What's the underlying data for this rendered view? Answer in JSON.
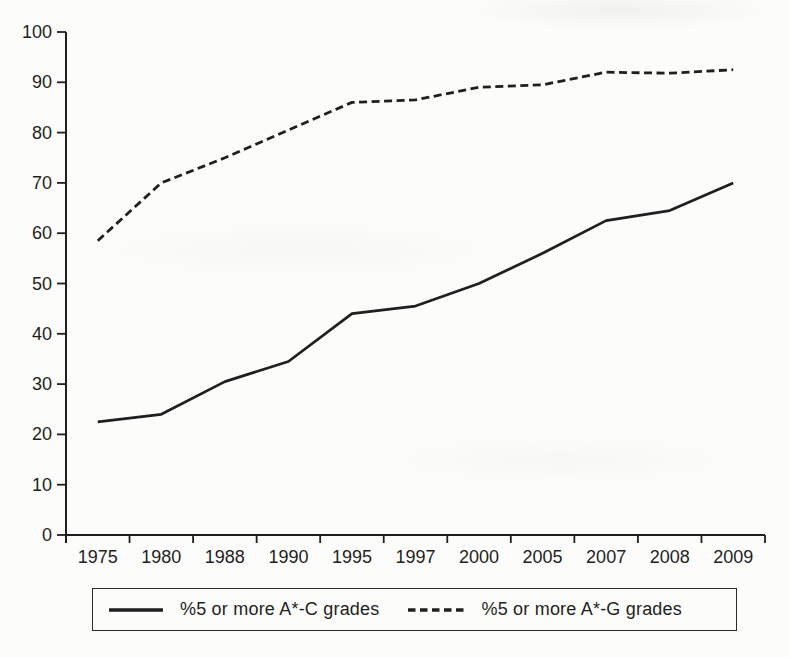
{
  "page": {
    "background": "#fcfcfa",
    "ink_color": "#1f1f1f"
  },
  "chart_data": {
    "type": "line",
    "categories": [
      "1975",
      "1980",
      "1988",
      "1990",
      "1995",
      "1997",
      "2000",
      "2005",
      "2007",
      "2008",
      "2009"
    ],
    "series": [
      {
        "name": "%5 or more A*-C grades",
        "line_style": "solid",
        "values": [
          22.5,
          24,
          30.5,
          34.5,
          44,
          45.5,
          50,
          56,
          62.5,
          64.5,
          70
        ]
      },
      {
        "name": "%5 or more A*-G grades",
        "line_style": "dashed",
        "values": [
          58.5,
          70,
          75,
          80.5,
          86,
          86.5,
          89,
          89.5,
          92,
          91.8,
          92.5
        ]
      }
    ],
    "ylim": [
      0,
      100
    ],
    "yticks": [
      0,
      10,
      20,
      30,
      40,
      50,
      60,
      70,
      80,
      90,
      100
    ],
    "grid": false,
    "legend_position": "bottom",
    "line_color": "#1f1f1f"
  }
}
